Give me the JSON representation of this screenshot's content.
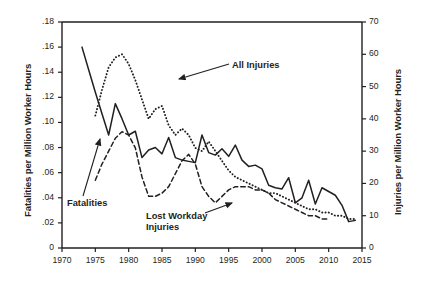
{
  "chart_data": {
    "type": "line",
    "title": "",
    "xlabel": "",
    "ylabel": "Fatalities per Million Worker Hours",
    "y2label": "Injuries per Million Worker Hours",
    "xlim": [
      1970,
      2015
    ],
    "ylim": [
      0,
      0.18
    ],
    "y2lim": [
      0,
      70
    ],
    "grid": false,
    "legend": "annotations-on-plot",
    "xticks": [
      "1970",
      "1975",
      "1980",
      "1985",
      "1990",
      "1995",
      "2000",
      "2005",
      "2010",
      "2015"
    ],
    "yticks": [
      "0",
      ".02",
      ".04",
      ".06",
      ".08",
      ".10",
      ".12",
      ".14",
      ".16",
      ".18"
    ],
    "y2ticks": [
      "0",
      "10",
      "20",
      "30",
      "40",
      "50",
      "60",
      "70"
    ],
    "annotations": [
      {
        "label": "All Injuries",
        "series": "All Injuries"
      },
      {
        "label": "Fatalities",
        "series": "Fatalities"
      },
      {
        "label": "Lost Workday Injuries",
        "series": "Lost Workday Injuries"
      }
    ],
    "series": [
      {
        "name": "Fatalities",
        "axis": "left",
        "style": "solid",
        "x": [
          1973,
          1974,
          1975,
          1976,
          1977,
          1978,
          1979,
          1980,
          1981,
          1982,
          1983,
          1984,
          1985,
          1986,
          1987,
          1988,
          1989,
          1990,
          1991,
          1992,
          1993,
          1994,
          1995,
          1996,
          1997,
          1998,
          1999,
          2000,
          2001,
          2002,
          2003,
          2004,
          2005,
          2006,
          2007,
          2008,
          2009,
          2010,
          2011,
          2012,
          2013,
          2014
        ],
        "values": [
          0.16,
          0.142,
          0.124,
          0.107,
          0.09,
          0.115,
          0.103,
          0.09,
          0.093,
          0.072,
          0.078,
          0.08,
          0.075,
          0.088,
          0.072,
          0.07,
          0.069,
          0.068,
          0.09,
          0.076,
          0.074,
          0.079,
          0.073,
          0.082,
          0.07,
          0.065,
          0.066,
          0.063,
          0.05,
          0.048,
          0.047,
          0.056,
          0.036,
          0.04,
          0.054,
          0.035,
          0.048,
          0.045,
          0.042,
          0.034,
          0.021,
          0.022
        ]
      },
      {
        "name": "All Injuries",
        "axis": "right",
        "style": "dotted",
        "x": [
          1975,
          1976,
          1977,
          1978,
          1979,
          1980,
          1981,
          1982,
          1983,
          1984,
          1985,
          1986,
          1987,
          1988,
          1989,
          1990,
          1991,
          1992,
          1993,
          1994,
          1995,
          1996,
          1997,
          1998,
          1999,
          2000,
          2001,
          2002,
          2003,
          2004,
          2005,
          2006,
          2007,
          2008,
          2009,
          2010,
          2011,
          2012,
          2013,
          2014
        ],
        "values": [
          41,
          49,
          56,
          59,
          60,
          57,
          52,
          46,
          40,
          43,
          44,
          38,
          35,
          37,
          35,
          31,
          30,
          33,
          30,
          27,
          24,
          22,
          21,
          20,
          19,
          18,
          17,
          17,
          16,
          15,
          14,
          13,
          12,
          12,
          11,
          11,
          10,
          10,
          9,
          9
        ]
      },
      {
        "name": "Lost Workday Injuries",
        "axis": "right",
        "style": "dashed",
        "x": [
          1975,
          1976,
          1977,
          1978,
          1979,
          1980,
          1981,
          1982,
          1983,
          1984,
          1985,
          1986,
          1987,
          1988,
          1989,
          1990,
          1991,
          1992,
          1993,
          1994,
          1995,
          1996,
          1997,
          1998,
          1999,
          2000,
          2001,
          2002,
          2003,
          2004,
          2005,
          2006,
          2007,
          2008,
          2009,
          2010
        ],
        "values": [
          21,
          26,
          30,
          34,
          36,
          35,
          31,
          22,
          16,
          16,
          17,
          19,
          23,
          27,
          29,
          26,
          19,
          16,
          14,
          16,
          18,
          19,
          19,
          19,
          18,
          18,
          17,
          15,
          14,
          13,
          12,
          11,
          10,
          10,
          9,
          9
        ]
      }
    ]
  },
  "axes": {
    "left_title": "Fatalities per Million Worker Hours",
    "right_title": "Injuries per Million Worker Hours"
  },
  "labels": {
    "all_injuries": "All Injuries",
    "fatalities": "Fatalities",
    "lost_workday_line1": "Lost Workday",
    "lost_workday_line2": "Injuries"
  },
  "colors": {
    "ink": "#231f20",
    "background": "#ffffff"
  }
}
